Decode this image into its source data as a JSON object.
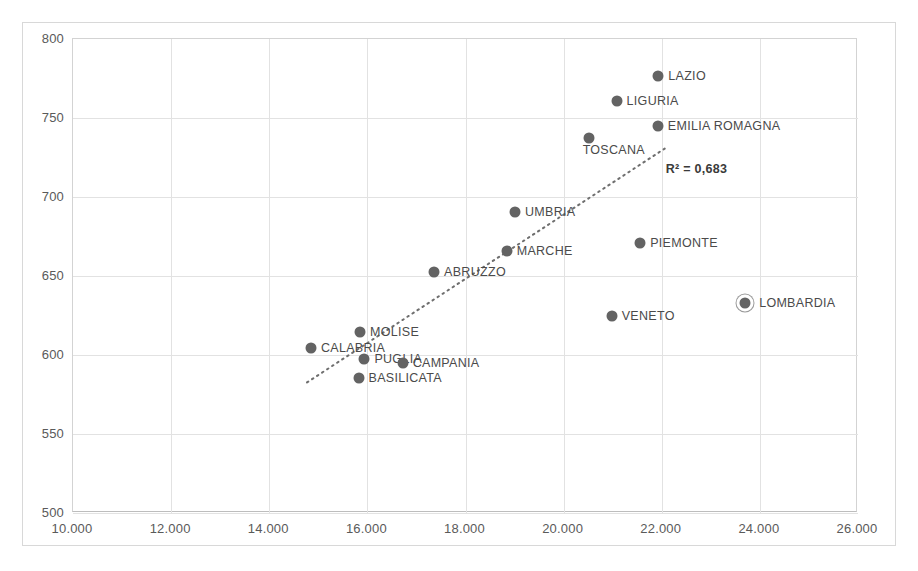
{
  "chart_data": {
    "type": "scatter",
    "title": "",
    "xlabel": "",
    "ylabel": "",
    "xlim": [
      10000,
      26000
    ],
    "ylim": [
      500,
      800
    ],
    "xticks": [
      10000,
      12000,
      14000,
      16000,
      18000,
      20000,
      22000,
      24000,
      26000
    ],
    "xticklabels": [
      "10.000",
      "12.000",
      "14.000",
      "16.000",
      "18.000",
      "20.000",
      "22.000",
      "24.000",
      "26.000"
    ],
    "yticks": [
      500,
      550,
      600,
      650,
      700,
      750,
      800
    ],
    "yticklabels": [
      "500",
      "550",
      "600",
      "650",
      "700",
      "750",
      "800"
    ],
    "grid": true,
    "legend": false,
    "marker_color": "#636363",
    "gridline_color": "#e2e2e2",
    "points": [
      {
        "label": "LAZIO",
        "x": 21950,
        "y": 776,
        "label_side": "right",
        "highlighted": false
      },
      {
        "label": "LIGURIA",
        "x": 21100,
        "y": 760,
        "label_side": "right",
        "highlighted": false
      },
      {
        "label": "EMILIA ROMAGNA",
        "x": 21940,
        "y": 744,
        "label_side": "right",
        "highlighted": false
      },
      {
        "label": "TOSCANA",
        "x": 20530,
        "y": 737,
        "label_side": "below",
        "highlighted": false
      },
      {
        "label": "UMBRIA",
        "x": 19030,
        "y": 690,
        "label_side": "right",
        "highlighted": false
      },
      {
        "label": "PIEMONTE",
        "x": 21580,
        "y": 670,
        "label_side": "right",
        "highlighted": false
      },
      {
        "label": "MARCHE",
        "x": 18860,
        "y": 665,
        "label_side": "right",
        "highlighted": false
      },
      {
        "label": "ABRUZZO",
        "x": 17380,
        "y": 652,
        "label_side": "right",
        "highlighted": false
      },
      {
        "label": "LOMBARDIA",
        "x": 23720,
        "y": 632,
        "label_side": "right",
        "highlighted": true
      },
      {
        "label": "VENETO",
        "x": 21000,
        "y": 624,
        "label_side": "right",
        "highlighted": false
      },
      {
        "label": "MOLISE",
        "x": 15870,
        "y": 614,
        "label_side": "right",
        "highlighted": false
      },
      {
        "label": "CALABRIA",
        "x": 14870,
        "y": 604,
        "label_side": "right",
        "highlighted": false
      },
      {
        "label": "PUGLIA",
        "x": 15960,
        "y": 597,
        "label_side": "right",
        "highlighted": false
      },
      {
        "label": "CAMPANIA",
        "x": 16740,
        "y": 594,
        "label_side": "right",
        "highlighted": false
      },
      {
        "label": "BASILICATA",
        "x": 15840,
        "y": 585,
        "label_side": "right",
        "highlighted": false
      }
    ],
    "trendline": {
      "style": "dotted",
      "color": "#6e6e6e",
      "x_start": 14790,
      "y_start": 582,
      "x_end": 22080,
      "y_end": 730
    },
    "annotations": [
      {
        "name": "r-squared",
        "text": "R² = 0,683",
        "x": 22100,
        "y": 717
      }
    ]
  }
}
